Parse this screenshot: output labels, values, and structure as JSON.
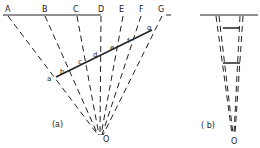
{
  "panel_a": {
    "caption": "(a)",
    "top_labels": [
      "A",
      "B",
      "C",
      "D",
      "E",
      "F",
      "G"
    ],
    "segment_labels": [
      "a",
      "b",
      "c",
      "d",
      "e",
      "f",
      "g"
    ],
    "origin_label": "O"
  },
  "panel_b": {
    "caption": "( b)",
    "origin_label": "O"
  },
  "colors": {
    "ink": "#222222"
  }
}
